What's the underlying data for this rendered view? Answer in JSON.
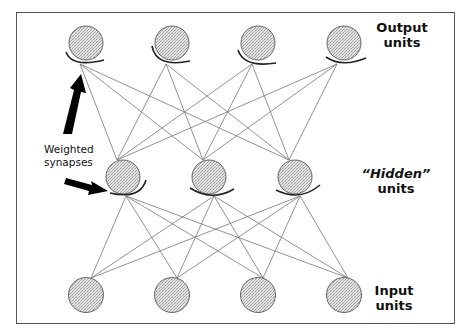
{
  "diagram": {
    "colors": {
      "frame": "#555555",
      "node_fill": "#d4d4d4",
      "node_stroke": "#666666",
      "connection": "#777777",
      "synapse_arc": "#222222",
      "arrow": "#000000",
      "text": "#111111"
    },
    "layers": {
      "output": {
        "label_line1": "Output",
        "label_line2": "units",
        "node_count": 4,
        "nodes": [
          {
            "id": "o1",
            "cx": 86,
            "cy": 43
          },
          {
            "id": "o2",
            "cx": 172,
            "cy": 43
          },
          {
            "id": "o3",
            "cx": 258,
            "cy": 43
          },
          {
            "id": "o4",
            "cx": 344,
            "cy": 43
          }
        ]
      },
      "hidden": {
        "label_line1": "“Hidden”",
        "label_line2": "units",
        "node_count": 3,
        "nodes": [
          {
            "id": "h1",
            "cx": 123,
            "cy": 177
          },
          {
            "id": "h2",
            "cx": 209,
            "cy": 177
          },
          {
            "id": "h3",
            "cx": 295,
            "cy": 177
          }
        ]
      },
      "input": {
        "label_line1": "Input",
        "label_line2": "units",
        "node_count": 4,
        "nodes": [
          {
            "id": "i1",
            "cx": 86,
            "cy": 295
          },
          {
            "id": "i2",
            "cx": 172,
            "cy": 295
          },
          {
            "id": "i3",
            "cx": 258,
            "cy": 295
          },
          {
            "id": "i4",
            "cx": 344,
            "cy": 295
          }
        ]
      }
    },
    "annotation": {
      "line1": "Weighted",
      "line2": "synapses"
    },
    "connections": {
      "hidden_to_output": "all-to-all",
      "input_to_hidden": "all-to-all"
    }
  }
}
